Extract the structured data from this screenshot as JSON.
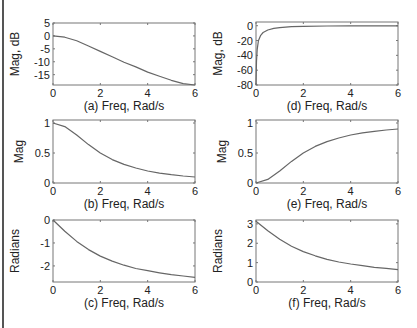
{
  "figure": {
    "line_color": "#666666",
    "axis_color": "#777777",
    "text_color": "#222222"
  },
  "chart_data": [
    {
      "id": "a",
      "type": "line",
      "title": "",
      "xlabel": "(a) Freq, Rad/s",
      "ylabel": "Mag, dB",
      "xlim": [
        0,
        6
      ],
      "ylim": [
        -19,
        5
      ],
      "xticks": [
        0,
        2,
        4,
        6
      ],
      "yticks": [
        5,
        0,
        -5,
        -10,
        -15
      ],
      "grid": false,
      "x": [
        0,
        0.5,
        1,
        1.5,
        2,
        2.5,
        3,
        3.5,
        4,
        4.5,
        5,
        5.5,
        6
      ],
      "series": [
        {
          "name": "Low-pass magnitude (dB)",
          "values": [
            0,
            -0.5,
            -1.9,
            -3.9,
            -6.0,
            -8.1,
            -10.2,
            -12.0,
            -14.0,
            -15.6,
            -17.2,
            -18.5,
            -19.8
          ]
        }
      ]
    },
    {
      "id": "b",
      "type": "line",
      "title": "",
      "xlabel": "(b) Freq, Rad/s",
      "ylabel": "Mag",
      "xlim": [
        0,
        6
      ],
      "ylim": [
        0,
        1.05
      ],
      "xticks": [
        0,
        2,
        4,
        6
      ],
      "yticks": [
        1,
        0.5,
        0
      ],
      "grid": false,
      "x": [
        0,
        0.5,
        1,
        1.5,
        2,
        2.5,
        3,
        3.5,
        4,
        4.5,
        5,
        5.5,
        6
      ],
      "series": [
        {
          "name": "Low-pass magnitude",
          "values": [
            1.0,
            0.94,
            0.8,
            0.64,
            0.5,
            0.39,
            0.31,
            0.25,
            0.2,
            0.165,
            0.138,
            0.117,
            0.1
          ]
        }
      ]
    },
    {
      "id": "c",
      "type": "line",
      "title": "",
      "xlabel": "(c) Freq, Rad/s",
      "ylabel": "Radians",
      "xlim": [
        0,
        6
      ],
      "ylim": [
        -2.7,
        0
      ],
      "xticks": [
        0,
        2,
        4,
        6
      ],
      "yticks": [
        0,
        -1,
        -2
      ],
      "grid": false,
      "x": [
        0,
        0.5,
        1,
        1.5,
        2,
        2.5,
        3,
        3.5,
        4,
        4.5,
        5,
        5.5,
        6
      ],
      "series": [
        {
          "name": "Low-pass phase",
          "values": [
            0,
            -0.49,
            -0.93,
            -1.29,
            -1.57,
            -1.79,
            -1.97,
            -2.11,
            -2.21,
            -2.3,
            -2.38,
            -2.44,
            -2.5
          ]
        }
      ]
    },
    {
      "id": "d",
      "type": "line",
      "title": "",
      "xlabel": "(d) Freq, Rad/s",
      "ylabel": "Mag, dB",
      "xlim": [
        0,
        6
      ],
      "ylim": [
        -80,
        5
      ],
      "xticks": [
        0,
        2,
        4,
        6
      ],
      "yticks": [
        0,
        -20,
        -40,
        -60,
        -80
      ],
      "grid": false,
      "x": [
        0.005,
        0.02,
        0.05,
        0.1,
        0.2,
        0.3,
        0.5,
        0.75,
        1,
        1.5,
        2,
        3,
        4,
        5,
        6
      ],
      "series": [
        {
          "name": "High-pass magnitude (dB)",
          "values": [
            -72,
            -48,
            -32,
            -20.4,
            -12.9,
            -9.1,
            -5.8,
            -3.5,
            -2.5,
            -1.2,
            -0.8,
            -0.45,
            -0.28,
            -0.18,
            -0.13
          ]
        }
      ]
    },
    {
      "id": "e",
      "type": "line",
      "title": "",
      "xlabel": "(e) Freq, Rad/s",
      "ylabel": "Mag",
      "xlim": [
        0,
        6
      ],
      "ylim": [
        0,
        1.05
      ],
      "xticks": [
        0,
        2,
        4,
        6
      ],
      "yticks": [
        1,
        0.5,
        0
      ],
      "grid": false,
      "x": [
        0,
        0.5,
        1,
        1.5,
        2,
        2.5,
        3,
        3.5,
        4,
        4.5,
        5,
        5.5,
        6
      ],
      "series": [
        {
          "name": "High-pass magnitude",
          "values": [
            0,
            0.06,
            0.2,
            0.36,
            0.5,
            0.61,
            0.69,
            0.75,
            0.8,
            0.835,
            0.862,
            0.883,
            0.9
          ]
        }
      ]
    },
    {
      "id": "f",
      "type": "line",
      "title": "",
      "xlabel": "(f) Freq, Rad/s",
      "ylabel": "Radians",
      "xlim": [
        0,
        6
      ],
      "ylim": [
        0,
        3.2
      ],
      "xticks": [
        0,
        2,
        4,
        6
      ],
      "yticks": [
        3,
        2,
        1,
        0
      ],
      "grid": false,
      "x": [
        0,
        0.5,
        1,
        1.5,
        2,
        2.5,
        3,
        3.5,
        4,
        4.5,
        5,
        5.5,
        6
      ],
      "series": [
        {
          "name": "High-pass phase",
          "values": [
            3.14,
            2.65,
            2.21,
            1.85,
            1.57,
            1.35,
            1.17,
            1.03,
            0.93,
            0.84,
            0.76,
            0.7,
            0.64
          ]
        }
      ]
    }
  ]
}
